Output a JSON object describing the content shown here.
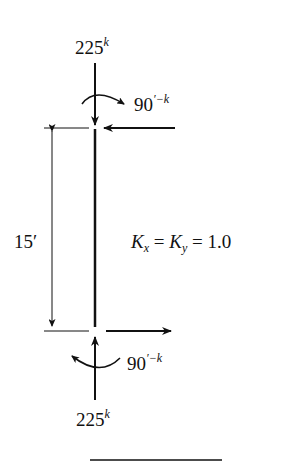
{
  "diagram": {
    "type": "column-free-body",
    "top_axial_load": {
      "value": "225",
      "unit_sup": "k"
    },
    "top_moment": {
      "value": "90",
      "unit_sup": "′−k"
    },
    "bottom_axial_load": {
      "value": "225",
      "unit_sup": "k"
    },
    "bottom_moment": {
      "value": "90",
      "unit_sup": "′−k"
    },
    "length": "15′",
    "effective_length": {
      "k1": "K",
      "k1_sub": "x",
      "eq1": " = ",
      "k2": "K",
      "k2_sub": "y",
      "eq2": " = 1.0"
    },
    "colors": {
      "ink": "#111111",
      "background": "#ffffff"
    }
  }
}
